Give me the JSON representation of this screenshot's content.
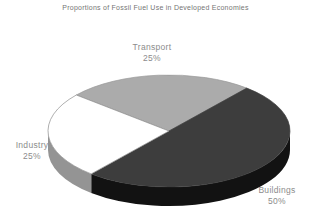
{
  "chart_data": {
    "type": "pie",
    "style": "3d-exploded-none",
    "title": "Proportions of Fossil Fuel Use in Developed Economies",
    "categories": [
      "Transport",
      "Buildings",
      "Industry"
    ],
    "values": [
      25,
      50,
      25
    ],
    "unit": "%",
    "legend": "none",
    "background": "#ffffff",
    "title_color": "#757575",
    "label_color": "#8c8c8c",
    "start_angle_deg": 140,
    "direction": "clockwise",
    "geometry": {
      "cx": 169,
      "cy": 131,
      "rx": 121,
      "ry": 56,
      "depth": 19
    },
    "segments": [
      {
        "label": "Transport",
        "value": 25,
        "value_label": "25%",
        "color": "#ababab",
        "stroke": "#9a9a9a",
        "side_color": "#8f8f8f"
      },
      {
        "label": "Buildings",
        "value": 50,
        "value_label": "50%",
        "color": "#3d3d3d",
        "stroke": "#3d3d3d",
        "side_color": "#121212"
      },
      {
        "label": "Industry",
        "value": 25,
        "value_label": "25%",
        "color": "#ffffff",
        "stroke": "#8c8c8c",
        "side_color": "#949494"
      }
    ]
  }
}
